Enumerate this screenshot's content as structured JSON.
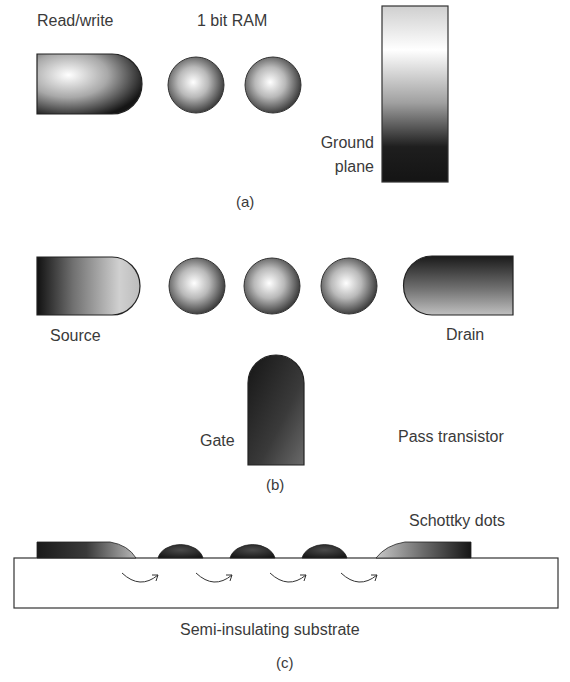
{
  "panel_a": {
    "read_write_label": "Read/write",
    "ram_label": "1 bit RAM",
    "ground_plane_label_line1": "Ground",
    "ground_plane_label_line2": "plane",
    "caption": "(a)"
  },
  "panel_b": {
    "source_label": "Source",
    "drain_label": "Drain",
    "gate_label": "Gate",
    "title": "Pass transistor",
    "caption": "(b)"
  },
  "panel_c": {
    "schottky_label": "Schottky dots",
    "substrate_label": "Semi-insulating substrate",
    "caption": "(c)"
  }
}
